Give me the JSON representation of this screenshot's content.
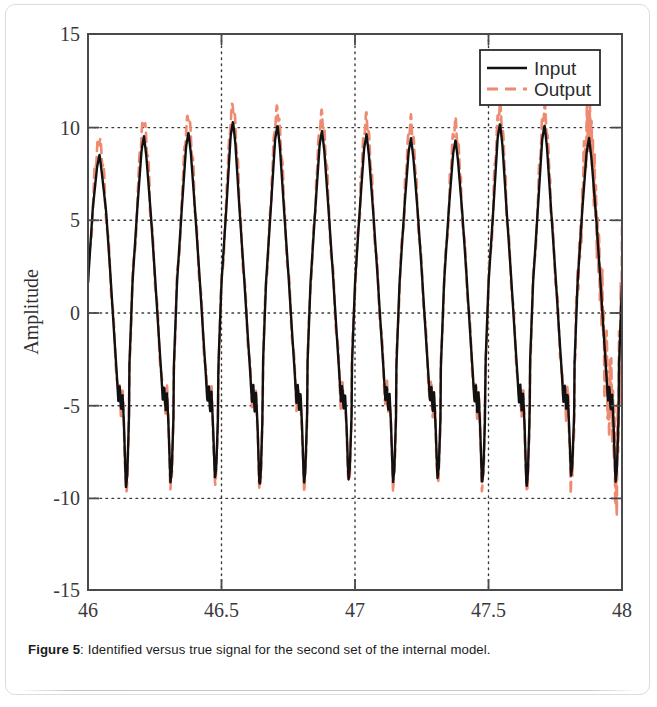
{
  "caption": {
    "label": "Figure 5",
    "separator": ":",
    "text": " Identified versus true signal for the second set of the internal model."
  },
  "colors": {
    "input_line": "#111111",
    "output_line": "#ED8A70",
    "axis": "#4a4a4c",
    "grid": "#3a3a3c",
    "text": "#2f2f31",
    "page_background": "#ffffff",
    "frame": "#dcdcdc"
  },
  "chart_data": {
    "type": "line",
    "title": "",
    "xlabel": "Time (s)",
    "ylabel": "Amplitude",
    "xlim": [
      46,
      48
    ],
    "ylim": [
      -15,
      15
    ],
    "xticks": [
      46,
      46.5,
      47,
      47.5,
      48
    ],
    "xtick_labels": [
      "46",
      "46.5",
      "47",
      "47.5",
      "48"
    ],
    "yticks": [
      -15,
      -10,
      -5,
      0,
      5,
      10,
      15
    ],
    "ytick_labels": [
      "-15",
      "-10",
      "-5",
      "0",
      "5",
      "10",
      "15"
    ],
    "grid": true,
    "grid_style": "dotted",
    "legend": {
      "position": "upper right",
      "entries": [
        {
          "name": "Input",
          "color": "#111111",
          "style": "solid"
        },
        {
          "name": "Output",
          "color": "#ED8A70",
          "style": "dashed"
        }
      ]
    },
    "waveform": {
      "description": "quasi-periodic sawtooth with sharp rise, slow decay, a small zigzag notch near -5 and a deep narrow trough near -9",
      "period": 0.1667,
      "cycles": 12,
      "peak_values": [
        8.5,
        9.5,
        9.7,
        10.3,
        10.1,
        9.8,
        9.6,
        9.4,
        9.3,
        10.2,
        10.1,
        9.4
      ],
      "trough_values": [
        -9.5,
        -9.2,
        -9.0,
        -9.4,
        -9.3,
        -9.1,
        -9.2,
        -9.0,
        -9.3,
        -9.5,
        -8.9,
        -9.2
      ],
      "notch_level": -4.9
    },
    "series": [
      {
        "name": "Input",
        "color": "#111111",
        "style": "solid",
        "x": [
          46.0,
          46.01,
          46.02,
          46.03,
          46.05,
          46.06,
          46.07,
          46.08,
          46.09,
          46.1,
          46.11,
          46.12,
          46.125,
          46.13,
          46.14,
          46.15,
          46.16,
          46.17,
          46.18,
          46.19,
          46.2,
          46.21,
          46.22,
          46.23,
          46.24,
          46.25,
          46.26,
          46.27,
          46.28,
          46.29,
          46.3,
          46.31,
          46.32,
          46.33,
          46.34,
          46.35,
          46.36,
          46.37,
          46.38,
          46.39,
          46.4,
          46.41,
          46.42,
          46.43,
          46.44,
          46.45,
          46.46,
          46.47,
          46.48,
          46.49,
          46.5,
          46.51,
          46.52,
          46.53,
          46.54,
          46.55,
          46.56,
          46.57,
          46.58,
          46.59,
          46.6,
          46.61,
          46.62,
          46.63,
          46.64,
          46.65,
          46.66,
          46.67,
          46.68,
          46.69,
          46.7,
          46.71,
          46.72,
          46.73,
          46.74,
          46.75,
          46.76,
          46.77,
          46.78,
          46.79,
          46.8,
          46.81,
          46.82,
          46.83,
          46.84,
          46.85,
          46.86,
          46.87,
          46.88,
          46.89,
          46.9,
          46.91,
          46.92,
          46.93,
          46.94,
          46.95,
          46.96,
          46.97,
          46.98,
          46.99,
          47.0,
          47.05,
          47.1,
          47.15,
          47.2,
          47.25,
          47.3,
          47.35,
          47.4,
          47.45,
          47.5,
          47.55,
          47.6,
          47.65,
          47.7,
          47.75,
          47.8,
          47.85,
          47.9,
          47.95,
          48.0
        ],
        "y_note": "dense sampled trace rendered procedurally from waveform parameters"
      },
      {
        "name": "Output",
        "color": "#ED8A70",
        "style": "dashed",
        "x_note": "same x grid as Input",
        "y_note": "follows Input with peak overshoot of ~+1 and increased oscillation after t=47.75"
      }
    ]
  }
}
